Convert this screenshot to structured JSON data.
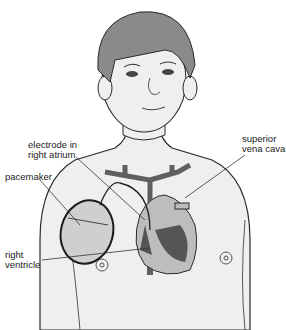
{
  "diagram": {
    "labels": {
      "electrode_line1": "electrode in",
      "electrode_line2": "right atrium",
      "pacemaker": "pacemaker",
      "svc_line1": "superior",
      "svc_line2": "vena cava",
      "rv_line1": "right",
      "rv_line2": "ventricle"
    },
    "colors": {
      "skin": "#efefef",
      "hair": "#8a8a8a",
      "outline": "#2a2a2a",
      "vessel": "#5f5f5f",
      "heart_light": "#bdbdbd",
      "heart_dark": "#555555",
      "pacemaker_fill": "#cfcfcf"
    }
  }
}
